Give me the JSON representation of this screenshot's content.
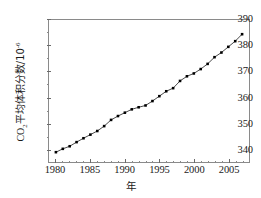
{
  "chart_data": {
    "type": "line",
    "title": "",
    "subtitle": "",
    "xlabel": "年",
    "ylabel_prefix": "CO",
    "ylabel_sub": "2",
    "ylabel_mid": "平均体积分数/10",
    "ylabel_sup": "-6",
    "ylabel_full": "CO2平均体积分数/10^-6",
    "xlim": [
      1979,
      2008
    ],
    "ylim": [
      335,
      390
    ],
    "grid": false,
    "legend": null,
    "marker": "filled-square",
    "line_color": "#1a1a1a",
    "marker_color": "#000000",
    "frame_color": "#8a8a8a",
    "x_ticks": [
      1980,
      1985,
      1990,
      1995,
      2000,
      2005
    ],
    "x_minor_ticks": [
      1981,
      1982,
      1983,
      1984,
      1986,
      1987,
      1988,
      1989,
      1991,
      1992,
      1993,
      1994,
      1996,
      1997,
      1998,
      1999,
      2001,
      2002,
      2003,
      2004,
      2006,
      2007
    ],
    "y_ticks": [
      340,
      350,
      360,
      370,
      380,
      390
    ],
    "y_minor_ticks": [
      345,
      355,
      365,
      375,
      385
    ],
    "x": [
      1980,
      1981,
      1982,
      1983,
      1984,
      1985,
      1986,
      1987,
      1988,
      1989,
      1990,
      1991,
      1992,
      1993,
      1994,
      1995,
      1996,
      1997,
      1998,
      1999,
      2000,
      2001,
      2002,
      2003,
      2004,
      2005,
      2006,
      2007
    ],
    "values": [
      338.8,
      340.1,
      341.1,
      342.7,
      344.2,
      345.6,
      347.0,
      348.9,
      351.3,
      352.8,
      354.1,
      355.4,
      356.2,
      356.9,
      358.6,
      360.5,
      362.4,
      363.6,
      366.4,
      368.2,
      369.3,
      371.0,
      373.0,
      375.6,
      377.4,
      379.6,
      381.8,
      384.5
    ],
    "series_name": "CO2 平均体积分数"
  },
  "axis": {
    "x_tick_labels": [
      "1980",
      "1985",
      "1990",
      "1995",
      "2000",
      "2005"
    ],
    "y_tick_labels": [
      "340",
      "350",
      "360",
      "370",
      "380",
      "390"
    ]
  }
}
